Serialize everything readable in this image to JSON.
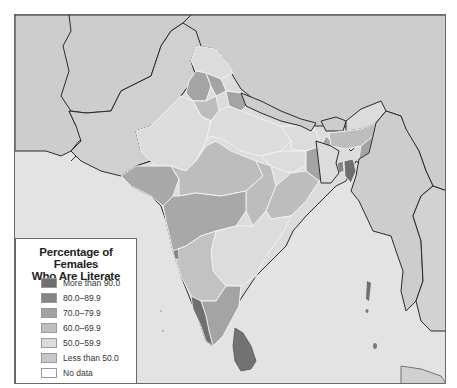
{
  "map": {
    "title": "Female literacy in South Asia",
    "region": "India and neighboring countries",
    "colors": {
      "background_land": "#d6d6d6",
      "water": "#e4e4e4",
      "neighbors": "#cfcfcf",
      "border": "#2a2a2a",
      "state_border": "#f2f2f2"
    }
  },
  "legend": {
    "title_line1": "Percentage of Females",
    "title_line2": "Who Are Literate",
    "items": [
      {
        "label": "More than 90.0",
        "color": "#6f6f6f"
      },
      {
        "label": "80.0–89.9",
        "color": "#858585"
      },
      {
        "label": "70.0–79.9",
        "color": "#a2a2a2"
      },
      {
        "label": "60.0–69.9",
        "color": "#bdbdbd"
      },
      {
        "label": "50.0–59.9",
        "color": "#dcdcdc"
      },
      {
        "label": "Less than 50.0",
        "color": "#c8c8c8"
      },
      {
        "label": "No data",
        "color": "#ffffff"
      }
    ]
  }
}
